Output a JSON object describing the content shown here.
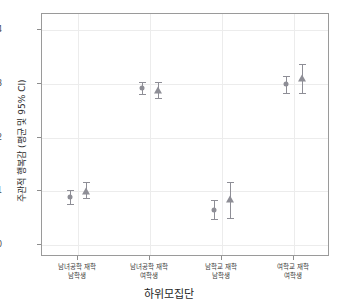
{
  "title": "",
  "chart_data": {
    "type": "scatter",
    "title": "",
    "xlabel": "하위모집단",
    "ylabel": "주관적 행복감 (평균 및 95% CI)",
    "ylim": [
      1.97,
      2.42
    ],
    "yticks": [
      2.0,
      2.1,
      2.2,
      2.3,
      2.4
    ],
    "ytick_labels": [
      "2.0",
      "2.1",
      "2.2",
      "2.3",
      "2.4"
    ],
    "grid": true,
    "legend": "none",
    "categories": [
      {
        "line1": "남녀공학 재학",
        "line2": "남학생"
      },
      {
        "line1": "남녀공학 재학",
        "line2": "여학생"
      },
      {
        "line1": "남학교 재학",
        "line2": "남학생"
      },
      {
        "line1": "여학교 재학",
        "line2": "여학생"
      }
    ],
    "series": [
      {
        "name": "circle",
        "marker": "circle",
        "color": "#8e8e96",
        "values": [
          2.089,
          2.292,
          2.066,
          2.299
        ],
        "ci_low": [
          2.076,
          2.281,
          2.048,
          2.283
        ],
        "ci_high": [
          2.103,
          2.303,
          2.083,
          2.315
        ]
      },
      {
        "name": "triangle",
        "marker": "triangle",
        "color": "#8e8e96",
        "values": [
          2.101,
          2.289,
          2.086,
          2.311
        ],
        "ci_low": [
          2.088,
          2.273,
          2.051,
          2.283
        ],
        "ci_high": [
          2.118,
          2.303,
          2.117,
          2.337
        ]
      }
    ]
  }
}
